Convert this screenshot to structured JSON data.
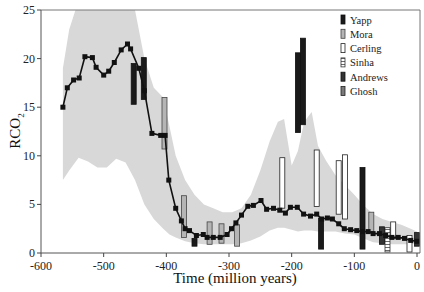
{
  "chart_data": {
    "type": "line",
    "title": "",
    "xlabel": "Time (million years)",
    "ylabel": "RCO2",
    "ylabel_main": "RCO",
    "ylabel_sub": "2",
    "xlim": [
      -600,
      0
    ],
    "ylim": [
      0,
      25
    ],
    "x_ticks": [
      -600,
      -500,
      -400,
      -300,
      -200,
      -100,
      0
    ],
    "x_tick_labels": [
      "-600",
      "-500",
      "-400",
      "-300",
      "-200",
      "-100",
      "0"
    ],
    "y_ticks": [
      0,
      5,
      10,
      15,
      20,
      25
    ],
    "y_tick_labels": [
      "0",
      "5",
      "10",
      "15",
      "20",
      "25"
    ],
    "grid": false,
    "legend_position": "upper right",
    "model_curve": {
      "name": "Model",
      "color": "#111111",
      "x": [
        -565,
        -558,
        -548,
        -539,
        -530,
        -518,
        -512,
        -500,
        -492,
        -483,
        -472,
        -462,
        -457,
        -444,
        -435,
        -423,
        -409,
        -402,
        -396,
        -385,
        -376,
        -370,
        -363,
        -352,
        -341,
        -335,
        -325,
        -314,
        -303,
        -296,
        -289,
        -280,
        -270,
        -261,
        -249,
        -240,
        -229,
        -219,
        -210,
        -202,
        -191,
        -181,
        -170,
        -160,
        -152,
        -143,
        -135,
        -125,
        -116,
        -106,
        -96,
        -87,
        -78,
        -70,
        -60,
        -50,
        -40,
        -30,
        -20,
        -10,
        0
      ],
      "values": [
        15.0,
        17.0,
        17.8,
        18.0,
        20.2,
        20.1,
        19.1,
        18.3,
        18.7,
        19.6,
        20.9,
        21.5,
        21.0,
        19.0,
        16.7,
        12.3,
        12.1,
        12.1,
        7.5,
        4.6,
        3.3,
        2.5,
        2.3,
        1.8,
        1.9,
        1.6,
        1.6,
        1.6,
        1.9,
        2.5,
        3.1,
        3.9,
        4.8,
        4.9,
        5.4,
        4.5,
        4.6,
        4.4,
        4.1,
        4.7,
        4.7,
        4.0,
        3.8,
        4.0,
        3.5,
        3.6,
        3.5,
        3.0,
        2.5,
        2.4,
        2.3,
        2.2,
        2.2,
        2.0,
        2.0,
        1.8,
        1.6,
        1.6,
        1.5,
        1.3,
        1.2
      ]
    },
    "uncertainty_band": {
      "name": "Model uncertainty",
      "color": "#d8d8d8",
      "x": [
        -565,
        -555,
        -540,
        -525,
        -510,
        -495,
        -480,
        -465,
        -450,
        -435,
        -420,
        -405,
        -395,
        -385,
        -370,
        -355,
        -340,
        -325,
        -310,
        -295,
        -280,
        -265,
        -250,
        -235,
        -222,
        -212,
        -200,
        -190,
        -180,
        -168,
        -158,
        -145,
        -130,
        -115,
        -100,
        -85,
        -70,
        -55,
        -40,
        -25,
        -10,
        0
      ],
      "upper": [
        19,
        23,
        26,
        27,
        27,
        27,
        27,
        27,
        25,
        20,
        17,
        16,
        13,
        10,
        7.5,
        6.0,
        5.0,
        4.6,
        4.2,
        4.2,
        4.6,
        6.0,
        8.5,
        11.5,
        13.5,
        13.8,
        9.0,
        10.5,
        13.5,
        14.5,
        11.0,
        9.5,
        8.0,
        7.0,
        6.0,
        4.9,
        4.0,
        3.5,
        3.2,
        2.9,
        2.5,
        2.2
      ],
      "lower": [
        7.5,
        8.5,
        9.8,
        9.4,
        8.8,
        8.8,
        9.7,
        9.3,
        7.5,
        5.0,
        3.5,
        2.5,
        1.9,
        1.6,
        1.2,
        1.0,
        0.9,
        0.9,
        0.9,
        0.9,
        1.0,
        1.3,
        1.7,
        2.3,
        2.6,
        2.6,
        2.4,
        2.2,
        2.3,
        2.3,
        2.2,
        2.2,
        2.2,
        2.0,
        1.9,
        1.5,
        1.1,
        1.0,
        0.9,
        0.9,
        0.9,
        1.0
      ]
    },
    "series": [
      {
        "name": "Yapp",
        "fill": "#1a1a1a",
        "stroke": "#111111",
        "pattern": "solid",
        "bars": [
          {
            "x": -452,
            "low": 15.3,
            "high": 19.5
          },
          {
            "x": -436,
            "low": 15.8,
            "high": 20.1
          },
          {
            "x": -190,
            "low": 12.4,
            "high": 20.6
          },
          {
            "x": -182,
            "low": 13.2,
            "high": 22.1
          },
          {
            "x": -355,
            "low": 0.7,
            "high": 1.5
          },
          {
            "x": -153,
            "low": 0.4,
            "high": 3.6
          },
          {
            "x": -87,
            "low": 0.4,
            "high": 8.8
          }
        ]
      },
      {
        "name": "Mora",
        "fill": "#b5b5b5",
        "stroke": "#444444",
        "pattern": "gray",
        "bars": [
          {
            "x": -403,
            "low": 10.7,
            "high": 16.0
          },
          {
            "x": -372,
            "low": 1.6,
            "high": 5.9
          },
          {
            "x": -331,
            "low": 0.9,
            "high": 3.2
          },
          {
            "x": -312,
            "low": 1.0,
            "high": 3.0
          },
          {
            "x": -287,
            "low": 0.7,
            "high": 2.9
          },
          {
            "x": -73,
            "low": 2.2,
            "high": 4.2
          }
        ]
      },
      {
        "name": "Cerling",
        "fill": "#ffffff",
        "stroke": "#222222",
        "pattern": "open",
        "bars": [
          {
            "x": -215,
            "low": 4.6,
            "high": 9.8
          },
          {
            "x": -160,
            "low": 4.8,
            "high": 10.6
          },
          {
            "x": -125,
            "low": 4.0,
            "high": 9.5
          },
          {
            "x": -115,
            "low": 3.5,
            "high": 10.1
          },
          {
            "x": -38,
            "low": 1.5,
            "high": 3.2
          },
          {
            "x": -12,
            "low": 0.1,
            "high": 1.8
          }
        ]
      },
      {
        "name": "Sinha",
        "fill": "#ffffff",
        "stroke": "#333333",
        "pattern": "hatched",
        "bars": [
          {
            "x": -47,
            "low": 0.1,
            "high": 2.6
          }
        ]
      },
      {
        "name": "Andrews",
        "fill": "#333333",
        "stroke": "#111111",
        "pattern": "dark",
        "bars": [
          {
            "x": -56,
            "low": 0.9,
            "high": 2.7
          },
          {
            "x": 0,
            "low": 0.7,
            "high": 2.1
          }
        ]
      },
      {
        "name": "Ghosh",
        "fill": "#7a7a7a",
        "stroke": "#222222",
        "pattern": "mid",
        "bars": [
          {
            "x": -56,
            "low": 0.9,
            "high": 2.7
          }
        ]
      }
    ],
    "legend": [
      "Yapp",
      "Mora",
      "Cerling",
      "Sinha",
      "Andrews",
      "Ghosh"
    ]
  }
}
